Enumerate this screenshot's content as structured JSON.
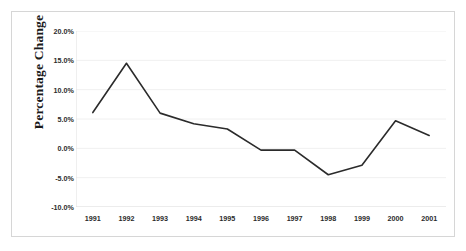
{
  "chart_data": {
    "type": "line",
    "title": "",
    "subtitle": "",
    "xlabel": "",
    "ylabel": "Percentage Change",
    "categories": [
      "1991",
      "1992",
      "1993",
      "1994",
      "1995",
      "1996",
      "1997",
      "1998",
      "1999",
      "2000",
      "2001"
    ],
    "values": [
      6.1,
      14.5,
      6.0,
      4.2,
      3.3,
      -0.3,
      -0.3,
      -4.5,
      -2.9,
      4.7,
      2.2
    ],
    "series": [
      {
        "name": "Percentage Change",
        "values": [
          6.1,
          14.5,
          6.0,
          4.2,
          3.3,
          -0.3,
          -0.3,
          -4.5,
          -2.9,
          4.7,
          2.2
        ]
      }
    ],
    "ylim": [
      -10.0,
      20.0
    ],
    "ytick_values": [
      20.0,
      15.0,
      10.0,
      5.0,
      0.0,
      -5.0,
      -10.0
    ],
    "ytick_labels": [
      "20.0%",
      "15.0%",
      "10.0%",
      "5.0%",
      "0.0%",
      "-5.0%",
      "-10.0%"
    ],
    "xtick_labels": [
      "1991",
      "1992",
      "1993",
      "1994",
      "1995",
      "1996",
      "1997",
      "1998",
      "1999",
      "2000",
      "2001"
    ],
    "grid": true,
    "legend": false,
    "legend_position": "none",
    "annotations": [],
    "line_color": "#2b2b2b",
    "line_width": 1.6,
    "markers": false,
    "grid_color": "#f0f0f0",
    "axis_color": "#e0e0e0",
    "background_color": "#ffffff",
    "frame_color": "#d6d6d6"
  }
}
